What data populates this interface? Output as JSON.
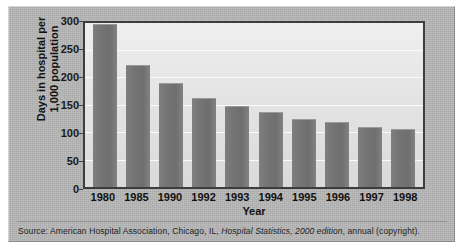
{
  "chart_data": {
    "type": "bar",
    "title": "",
    "xlabel": "Year",
    "ylabel": "Days in hospital per 1,000 population",
    "ylabel_line1": "Days in hospital per",
    "ylabel_line2": "1,000 population",
    "categories": [
      "1980",
      "1985",
      "1990",
      "1992",
      "1993",
      "1994",
      "1995",
      "1996",
      "1997",
      "1998"
    ],
    "values": [
      298,
      224,
      191,
      163,
      149,
      137,
      125,
      119,
      110,
      106
    ],
    "ylim": [
      0,
      300
    ],
    "yticks": [
      0,
      50,
      100,
      150,
      200,
      250,
      300
    ],
    "ytick_labels": [
      "0",
      "50",
      "100",
      "150",
      "200",
      "250",
      "300"
    ],
    "grid": "horizontal",
    "legend": "none",
    "bar_color": "#767676",
    "gridline_color": "#fbfbfb",
    "plot_background": "#e6e6e6",
    "panel_background": "#b6b6b6"
  },
  "source": {
    "prefix": "Source: American Hospital Association, Chicago, IL, ",
    "italic": "Hospital Statistics, 2000 edition",
    "suffix": ", annual (copyright)."
  }
}
